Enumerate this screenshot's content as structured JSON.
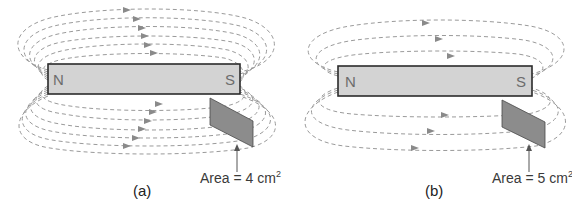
{
  "figure": {
    "panels": [
      {
        "id": "a",
        "caption": "(a)",
        "north_label": "N",
        "south_label": "S",
        "area_text": "Area = 4 cm",
        "area_exponent": "2",
        "field_lines_above": 6,
        "field_lines_below": 6
      },
      {
        "id": "b",
        "caption": "(b)",
        "north_label": "N",
        "south_label": "S",
        "area_text": "Area = 5 cm",
        "area_exponent": "2",
        "field_lines_above": 3,
        "field_lines_below": 3
      }
    ],
    "colors": {
      "magnet_fill": "#d3d3d3",
      "magnet_border": "#2b2b2b",
      "plate_fill": "#8c8c8c",
      "field_line": "#9a9a9a"
    }
  }
}
